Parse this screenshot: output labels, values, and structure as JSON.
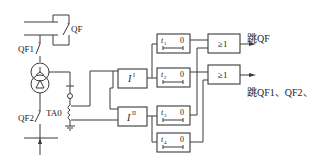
{
  "diagram": {
    "type": "relay protection logic diagram",
    "colors": {
      "line": "#3a3a3a",
      "background": "#ffffff",
      "text": "#222222"
    },
    "primary": {
      "breakers": [
        {
          "id": "QF",
          "label": "QF"
        },
        {
          "id": "QF1",
          "label": "QF1"
        },
        {
          "id": "QF2",
          "label": "QF2"
        }
      ],
      "transformer": {
        "hv_winding": "Y (star)",
        "lv_winding": "Δ (delta)"
      },
      "current_transformer": {
        "label": "TA0"
      }
    },
    "relays": [
      {
        "id": "I1",
        "symbol": "I",
        "sup": "I"
      },
      {
        "id": "I2",
        "symbol": "I",
        "sup": "II"
      }
    ],
    "timers": [
      {
        "id": "t1",
        "t": "t",
        "sub": "1",
        "zero": "0"
      },
      {
        "id": "t2",
        "t": "t",
        "sub": "2",
        "zero": "0"
      },
      {
        "id": "t3",
        "t": "t",
        "sub": "3",
        "zero": "0"
      },
      {
        "id": "t4",
        "t": "t",
        "sub": "4",
        "zero": "0"
      }
    ],
    "or_gates": [
      {
        "id": "or1",
        "label": "≥1"
      },
      {
        "id": "or2",
        "label": "≥1"
      }
    ],
    "outputs": [
      {
        "id": "out1",
        "label": "跳QF"
      },
      {
        "id": "out2",
        "label": "跳QF1、QF2、"
      }
    ],
    "connections": [
      "TA0 -> I1",
      "TA0 -> I2",
      "I1 -> t1",
      "I1 -> t2",
      "I2 -> t3",
      "I2 -> t4",
      "t1 -> or1",
      "t3 -> or1",
      "t2 -> or2",
      "t4 -> or2",
      "or1 -> 跳QF",
      "or2 -> 跳QF1、QF2、"
    ]
  }
}
